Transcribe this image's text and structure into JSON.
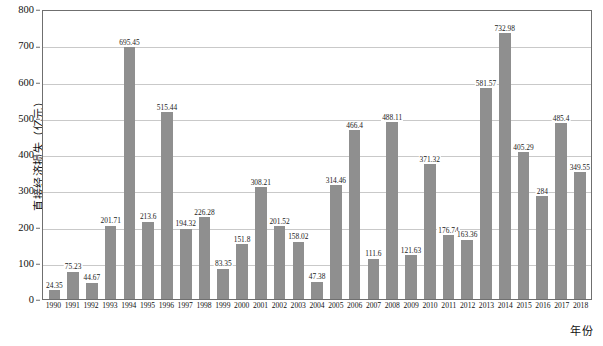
{
  "chart_data": {
    "type": "bar",
    "title": "",
    "xlabel": "年份",
    "ylabel": "直接经济损失（亿元）",
    "ylim": [
      0,
      800
    ],
    "yticks": [
      0,
      100,
      200,
      300,
      400,
      500,
      600,
      700,
      800
    ],
    "grid": true,
    "legend": "none",
    "series_color": "#8f8f8f",
    "categories": [
      "1990",
      "1991",
      "1992",
      "1993",
      "1994",
      "1995",
      "1996",
      "1997",
      "1998",
      "1999",
      "2000",
      "2001",
      "2002",
      "2003",
      "2004",
      "2005",
      "2006",
      "2007",
      "2008",
      "2009",
      "2010",
      "2011",
      "2012",
      "2013",
      "2014",
      "2015",
      "2016",
      "2017",
      "2018"
    ],
    "values": [
      24.35,
      75.23,
      44.67,
      201.71,
      695.45,
      213.6,
      515.44,
      194.32,
      226.28,
      83.35,
      151.8,
      308.21,
      201.52,
      158.02,
      47.38,
      314.46,
      466.4,
      111.6,
      488.11,
      121.63,
      371.32,
      176.74,
      163.36,
      581.57,
      732.98,
      405.29,
      284,
      485.4,
      349.55
    ],
    "value_labels": [
      "24.35",
      "75.23",
      "44.67",
      "201.71",
      "695.45",
      "213.6",
      "515.44",
      "194.32",
      "226.28",
      "83.35",
      "151.8",
      "308.21",
      "201.52",
      "158.02",
      "47.38",
      "314.46",
      "466.4",
      "111.6",
      "488.11",
      "121.63",
      "371.32",
      "176.74",
      "163.36",
      "581.57",
      "732.98",
      "405.29",
      "284",
      "485.4",
      "349.55"
    ]
  }
}
